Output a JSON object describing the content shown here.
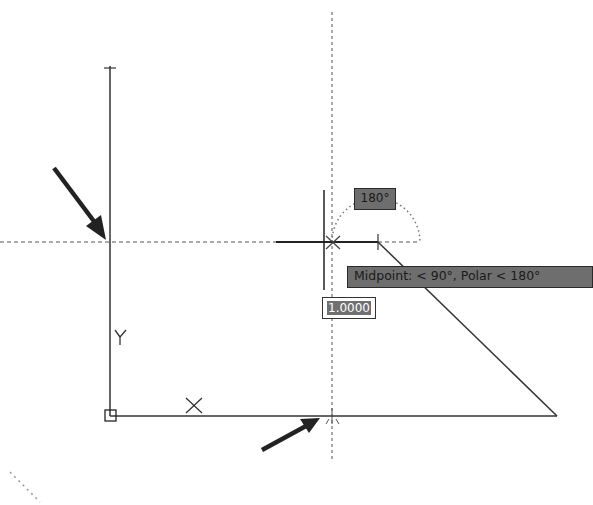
{
  "viewport": {
    "background": "#ffffff",
    "line_color": "#333333",
    "dash_color": "#666666"
  },
  "tooltips": {
    "angle_label": "180°",
    "polar_tracking": "Midpoint: < 90°,  Polar < 180°"
  },
  "dynamic_input": {
    "value": "1.0000"
  },
  "icons": {
    "ucs_y_label": "Y",
    "ucs_x_marker": "X"
  }
}
